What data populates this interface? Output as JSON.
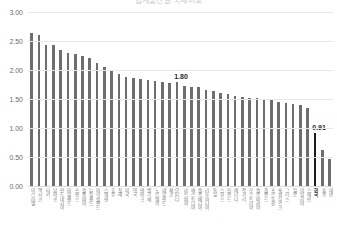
{
  "title": "합계출산율 국제비교",
  "chart_data": {
    "type": "bar",
    "title": "합계출산율 국제비교",
    "xlabel": "",
    "ylabel": "",
    "ylim": [
      0,
      3.0
    ],
    "ytick_labels": [
      "3.00",
      "2.50",
      "2.00",
      "1.50",
      "1.00",
      "0.50",
      "0.00"
    ],
    "ytick_values": [
      3.0,
      2.5,
      2.0,
      1.5,
      1.0,
      0.5,
      0.0
    ],
    "grid": true,
    "legend": "none",
    "bar_color": "#6e6e6e",
    "highlight_color": "#1d1d1d",
    "annotations": [
      {
        "label": "1.80",
        "category": "OECD",
        "value": 1.8
      },
      {
        "label": "0.91",
        "category": "한국",
        "value": 0.91
      }
    ],
    "categories": [
      "이스라엘",
      "멕시코",
      "터키",
      "남아공",
      "인도네시아",
      "아일랜드",
      "프랑스",
      "콜롬비아",
      "뉴질랜드",
      "아이슬란드",
      "스웨덴",
      "호주",
      "칠레",
      "미국",
      "영국",
      "덴마크",
      "벨기에",
      "노르웨이",
      "네덜란드",
      "체코",
      "OECD",
      "라트비아",
      "에스토니아",
      "슬로베니아",
      "리투아니아",
      "독일",
      "스위스",
      "핀란드",
      "캐나다",
      "헝가리",
      "오스트리아",
      "슬로바키아",
      "폴란드",
      "포르투갈",
      "룩셈부르크",
      "그리스",
      "일본",
      "이탈리아",
      "스페인",
      "한국",
      "홍콩",
      "대만"
    ],
    "values": [
      2.64,
      2.6,
      2.43,
      2.43,
      2.34,
      2.3,
      2.28,
      2.25,
      2.2,
      2.12,
      2.05,
      1.98,
      1.93,
      1.88,
      1.86,
      1.84,
      1.82,
      1.81,
      1.8,
      1.78,
      1.8,
      1.72,
      1.7,
      1.7,
      1.66,
      1.63,
      1.6,
      1.58,
      1.55,
      1.53,
      1.52,
      1.51,
      1.5,
      1.48,
      1.45,
      1.43,
      1.42,
      1.4,
      1.35,
      0.91,
      0.62,
      0.47
    ]
  }
}
